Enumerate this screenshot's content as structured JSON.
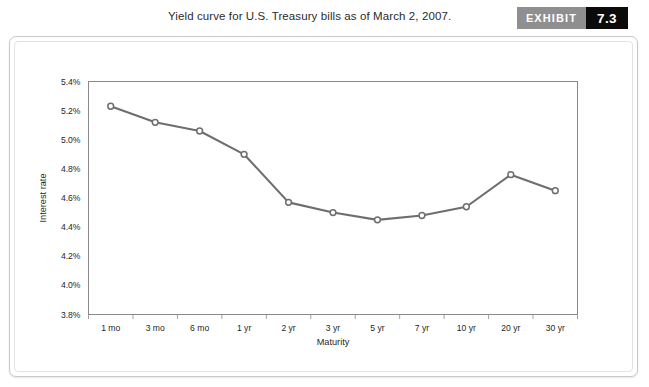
{
  "header": {
    "title": "Yield curve for U.S. Treasury bills as of March 2, 2007.",
    "exhibit_label": "EXHIBIT",
    "exhibit_number": "7.3"
  },
  "colors": {
    "line": "#6e6e6e",
    "marker_fill": "#ffffff",
    "grid": "#9a9a9a",
    "frame": "#8a8a8a",
    "exhibit_label_bg": "#8f8f8f",
    "exhibit_number_bg": "#0b0b0b",
    "card_border": "#c9c9c9",
    "text": "#1f1f1f"
  },
  "chart_data": {
    "type": "line",
    "title": "Yield curve for U.S. Treasury bills as of March 2, 2007.",
    "xlabel": "Maturity",
    "ylabel": "Interest rate",
    "categories": [
      "1 mo",
      "3 mo",
      "6 mo",
      "1 yr",
      "2 yr",
      "3 yr",
      "5 yr",
      "7 yr",
      "10 yr",
      "20 yr",
      "30 yr"
    ],
    "values": [
      5.23,
      5.12,
      5.06,
      4.9,
      4.57,
      4.5,
      4.45,
      4.48,
      4.54,
      4.76,
      4.65
    ],
    "series": [
      {
        "name": "U.S. Treasury yield",
        "values": [
          5.23,
          5.12,
          5.06,
          4.9,
          4.57,
          4.5,
          4.45,
          4.48,
          4.54,
          4.76,
          4.65
        ]
      }
    ],
    "ylim": [
      3.8,
      5.4
    ],
    "ytick_values": [
      3.8,
      4.0,
      4.2,
      4.4,
      4.6,
      4.8,
      5.0,
      5.2,
      5.4
    ],
    "ytick_labels": [
      "3.8%",
      "4.0%",
      "4.2%",
      "4.4%",
      "4.6%",
      "4.8%",
      "5.0%",
      "5.2%",
      "5.4%"
    ],
    "grid": "horizontal-and-vertical",
    "legend": "none",
    "marker": "open-circle"
  }
}
